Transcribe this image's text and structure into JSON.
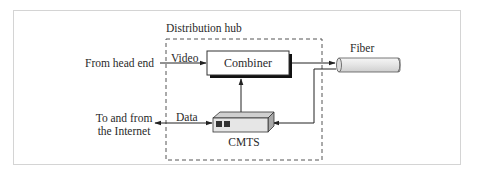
{
  "diagram": {
    "container_label": "Distribution hub",
    "nodes": {
      "combiner": "Combiner",
      "cmts": "CMTS",
      "fiber": "Fiber"
    },
    "inputs": {
      "head_end": "From head end",
      "internet_line1": "To and from",
      "internet_line2": "the Internet"
    },
    "edge_labels": {
      "video": "Video",
      "data": "Data"
    },
    "colors": {
      "line": "#222222",
      "dashed_border": "#555555",
      "box_fill": "#ffffff",
      "shadow": "#111111",
      "fiber_fill": "#e6e6e6",
      "cmts_fill": "#e2e2e2",
      "cmts_port": "#333333"
    }
  }
}
